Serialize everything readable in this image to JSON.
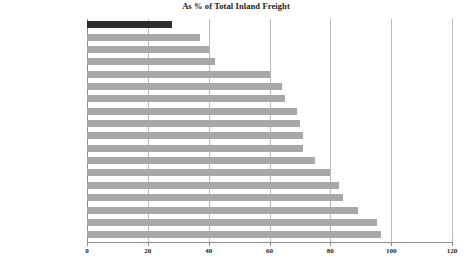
{
  "chart_data": {
    "type": "bar",
    "orientation": "horizontal",
    "title": "As % of Total Inland Freight",
    "xlabel": "",
    "ylabel": "",
    "xlim": [
      0,
      120
    ],
    "xticks": [
      0,
      20,
      40,
      60,
      80,
      100,
      120
    ],
    "grid": true,
    "legend": "none",
    "highlight_category": "United States",
    "colors": {
      "bar": "#a8a8a8",
      "highlight_bar": "#2e2e2e",
      "gridline": "#b9b9b9",
      "axis": "#8d8d8d",
      "text": "#1c1c1c",
      "background": "#ffffff"
    },
    "categories": [
      "United States",
      "Netherlands",
      "Austria",
      "Luxembourg",
      "Denmark",
      "Sweden",
      "Germany",
      "Switzerland",
      "France",
      "Finland",
      "Norway",
      "Belgium",
      "Portugal",
      "Italy",
      "United Kingdom",
      "Spain",
      "Greece",
      "Ireland"
    ],
    "values": [
      28,
      37,
      40,
      42,
      60,
      64,
      65,
      69,
      70,
      71,
      71,
      75,
      80,
      83,
      84,
      89,
      95.5,
      96.5
    ]
  }
}
